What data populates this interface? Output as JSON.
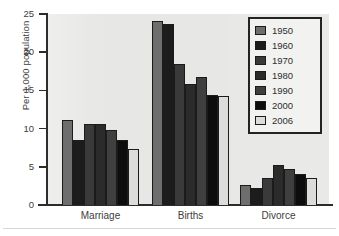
{
  "chart_data": {
    "type": "bar",
    "title": "",
    "subtitle": "",
    "xlabel": "",
    "ylabel": "Per 1,000 population",
    "ylim": [
      0,
      25
    ],
    "yticks": [
      0,
      5,
      10,
      15,
      20,
      25
    ],
    "grid": false,
    "legend_position": "top-right",
    "categories": [
      "Marriage",
      "Births",
      "Divorce"
    ],
    "series": [
      {
        "name": "1950",
        "color": "#6e6e6e",
        "values": [
          11.1,
          24.1,
          2.6
        ]
      },
      {
        "name": "1960",
        "color": "#1c1c1c",
        "values": [
          8.5,
          23.7,
          2.2
        ]
      },
      {
        "name": "1970",
        "color": "#3a3a3a",
        "values": [
          10.6,
          18.4,
          3.5
        ]
      },
      {
        "name": "1980",
        "color": "#2b2b2b",
        "values": [
          10.6,
          15.9,
          5.2
        ]
      },
      {
        "name": "1990",
        "color": "#3f3f3f",
        "values": [
          9.8,
          16.7,
          4.7
        ]
      },
      {
        "name": "2000",
        "color": "#0d0d0d",
        "values": [
          8.5,
          14.4,
          4.1
        ]
      },
      {
        "name": "2006",
        "color": "#dcdcda",
        "values": [
          7.3,
          14.3,
          3.6
        ]
      }
    ]
  },
  "axis": {
    "y_title": "Per 1,000 population",
    "y_tick_labels": [
      "25",
      "20",
      "15",
      "10",
      "5",
      "0"
    ],
    "x_tick_labels": [
      "Marriage",
      "Births",
      "Divorce"
    ]
  },
  "legend": {
    "entries": [
      {
        "label": "1950"
      },
      {
        "label": "1960"
      },
      {
        "label": "1970"
      },
      {
        "label": "1980"
      },
      {
        "label": "1990"
      },
      {
        "label": "2000"
      },
      {
        "label": "2006"
      }
    ]
  },
  "colors": {
    "panel_background": "#e7e7e5",
    "page_background": "#ffffff",
    "axis_line": "#2c2c2c",
    "bar_outline": "#1b1b1b",
    "legend_background": "#f2f2f0",
    "legend_border": "#232323",
    "text": "#3d3d3d"
  }
}
